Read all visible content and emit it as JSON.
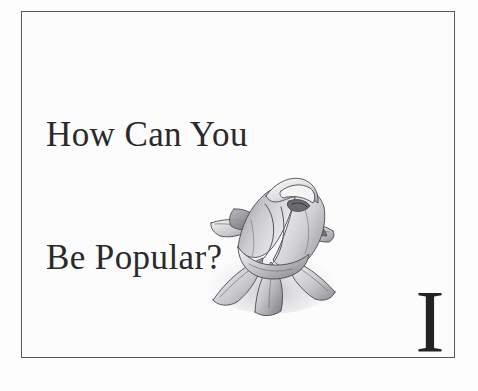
{
  "page": {
    "background_color": "#fdfdfd",
    "frame_color": "#58585c",
    "frame_inner_color": "#fcfcfc"
  },
  "chapter": {
    "title_line_1": "How Can You",
    "title_line_2": "Be Popular?",
    "title_color": "#2a2a2c",
    "numeral": "I",
    "numeral_color": "#232326"
  },
  "illustration": {
    "name": "rose-bud-pencil-drawing",
    "description": "Graphite pencil drawing of a single rose bud with sepals",
    "ink_color": "#4a4a4f",
    "shade_light": "#e4e4e6",
    "shade_mid": "#bcbcc0",
    "shade_dark": "#7e7e84"
  }
}
